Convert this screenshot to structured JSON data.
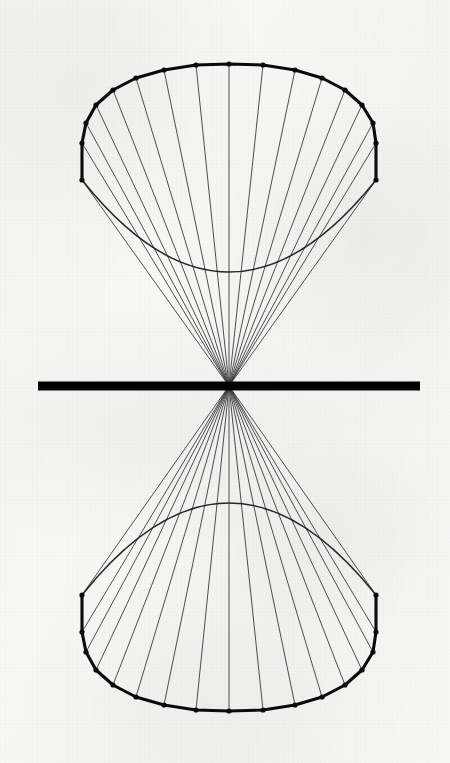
{
  "figure": {
    "subtitle": "",
    "caption": "",
    "background_color": "#fbfbfa",
    "ink_color": "#0a0a0a",
    "ruling_color": "#3a3a3a",
    "hidden_rim_color": "#262626"
  },
  "chart_data": {
    "type": "diagram",
    "canvas": {
      "width": 450,
      "height": 763
    },
    "apex": {
      "x": 229,
      "y": 386
    },
    "axis_line": {
      "label": "horizontal axis bar",
      "x1": 38,
      "y1": 386,
      "x2": 420,
      "y2": 386,
      "thickness": 9,
      "color": "#000000"
    },
    "upper_nappe": {
      "label": "upper cone",
      "polygon_sides": 16,
      "rim_center": {
        "x": 229,
        "y": 161
      },
      "rim_radius_x": 147,
      "rim_radius_y": 103,
      "near_rim_drop": 97,
      "vertices": [
        {
          "i": 0,
          "x": 376,
          "y": 143
        },
        {
          "i": 1,
          "x": 373,
          "y": 123
        },
        {
          "i": 2,
          "x": 362,
          "y": 105
        },
        {
          "i": 3,
          "x": 345,
          "y": 90
        },
        {
          "i": 4,
          "x": 322,
          "y": 78
        },
        {
          "i": 5,
          "x": 295,
          "y": 70
        },
        {
          "i": 6,
          "x": 263,
          "y": 65
        },
        {
          "i": 7,
          "x": 229,
          "y": 64
        },
        {
          "i": 8,
          "x": 196,
          "y": 65
        },
        {
          "i": 9,
          "x": 164,
          "y": 70
        },
        {
          "i": 10,
          "x": 136,
          "y": 78
        },
        {
          "i": 11,
          "x": 113,
          "y": 90
        },
        {
          "i": 12,
          "x": 96,
          "y": 105
        },
        {
          "i": 13,
          "x": 86,
          "y": 123
        },
        {
          "i": 14,
          "x": 82,
          "y": 143
        },
        {
          "i": 15,
          "x": 82,
          "y": 180
        }
      ],
      "right_edge_vertical": {
        "x": 376,
        "y_top": 143,
        "y_bottom": 180
      },
      "left_edge_vertical": {
        "x": 82,
        "y_top": 143,
        "y_bottom": 180
      },
      "hidden_rim_arc": {
        "from": {
          "x": 82,
          "y": 180
        },
        "to": {
          "x": 376,
          "y": 180
        },
        "lowest_y": 272
      }
    },
    "lower_nappe": {
      "label": "lower cone",
      "polygon_sides": 16,
      "rim_center": {
        "x": 229,
        "y": 612
      },
      "rim_radius_x": 147,
      "rim_radius_y": 103,
      "vertices": [
        {
          "i": 0,
          "x": 376,
          "y": 632
        },
        {
          "i": 1,
          "x": 373,
          "y": 652
        },
        {
          "i": 2,
          "x": 362,
          "y": 670
        },
        {
          "i": 3,
          "x": 345,
          "y": 685
        },
        {
          "i": 4,
          "x": 322,
          "y": 697
        },
        {
          "i": 5,
          "x": 295,
          "y": 705
        },
        {
          "i": 6,
          "x": 263,
          "y": 710
        },
        {
          "i": 7,
          "x": 229,
          "y": 711
        },
        {
          "i": 8,
          "x": 196,
          "y": 710
        },
        {
          "i": 9,
          "x": 164,
          "y": 705
        },
        {
          "i": 10,
          "x": 136,
          "y": 697
        },
        {
          "i": 11,
          "x": 113,
          "y": 685
        },
        {
          "i": 12,
          "x": 96,
          "y": 670
        },
        {
          "i": 13,
          "x": 86,
          "y": 652
        },
        {
          "i": 14,
          "x": 82,
          "y": 632
        },
        {
          "i": 15,
          "x": 82,
          "y": 595
        }
      ],
      "right_edge_vertical": {
        "x": 376,
        "y_top": 595,
        "y_bottom": 632
      },
      "left_edge_vertical": {
        "x": 82,
        "y_top": 595,
        "y_bottom": 632
      },
      "hidden_rim_arc": {
        "from": {
          "x": 82,
          "y": 595
        },
        "to": {
          "x": 376,
          "y": 595
        },
        "highest_y": 503
      }
    },
    "ruling_lines": {
      "count_per_nappe": 15,
      "stroke_width": 0.9,
      "color": "#3a3a3a",
      "note": "each polygon vertex is connected to the apex"
    },
    "styles": {
      "outline_stroke_width": 3.1,
      "vertex_dot_radius": 2.6,
      "hidden_rim_stroke_width": 1.5
    }
  }
}
